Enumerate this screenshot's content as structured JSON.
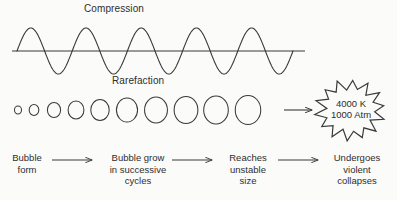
{
  "diagram": {
    "line_color": "#3a3a3a",
    "text_color": "#2e2e2e",
    "background_color": "#fbfbf9"
  },
  "wave": {
    "compression_label": "Compression",
    "rarefaction_label": "Rarefaction",
    "cycles": 5,
    "baseline_y": 51,
    "amplitude": 23,
    "start_x": 12,
    "end_x": 305
  },
  "bubbles": {
    "count": 10,
    "center_y": 110,
    "radii": [
      4,
      5.5,
      7.5,
      9,
      10.5,
      12,
      13,
      13.5,
      14,
      14.5
    ],
    "centers_x": [
      18,
      34,
      54,
      76,
      100,
      127,
      156,
      186,
      216,
      248
    ]
  },
  "collapse": {
    "arrow_label": "arrow-right",
    "burst_temperature": "4000 K",
    "burst_pressure": "1000 Atm",
    "burst_points": 14
  },
  "steps": [
    {
      "label": "Bubble\nform"
    },
    {
      "label": "Bubble grow\nin successive\ncycles"
    },
    {
      "label": "Reaches\nunstable\nsize"
    },
    {
      "label": "Undergoes\nviolent\ncollapses"
    }
  ],
  "step_arrows": [
    {
      "x1": 52,
      "x2": 92
    },
    {
      "x1": 172,
      "x2": 212
    },
    {
      "x1": 278,
      "x2": 318
    }
  ]
}
